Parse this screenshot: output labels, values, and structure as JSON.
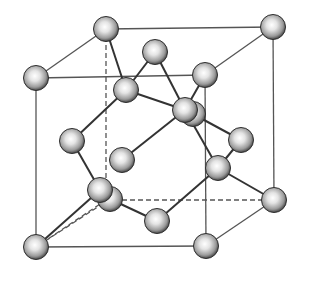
{
  "diagram": {
    "title": "Diamond cubic crystal structure (unit cell)",
    "colors": {
      "background": "#ffffff",
      "cell_edge": "#555555",
      "bond": "#333333",
      "atom_light": "#ffffff",
      "atom_mid": "#b5b5b5",
      "atom_dark": "#3a3a3a"
    },
    "atom_radius": 12.5,
    "cell": {
      "corners": {
        "back_top_left": [
          106,
          29
        ],
        "back_top_right": [
          273,
          27
        ],
        "back_bottom_left": [
          106,
          200
        ],
        "back_bottom_right": [
          274,
          200
        ],
        "front_top_left": [
          36,
          78
        ],
        "front_top_right": [
          205,
          75
        ],
        "front_bottom_left": [
          36,
          247
        ],
        "front_bottom_right": [
          206,
          246
        ]
      },
      "solid_edges": [
        [
          "front_top_left",
          "front_top_right"
        ],
        [
          "front_top_right",
          "front_bottom_right"
        ],
        [
          "front_bottom_right",
          "front_bottom_left"
        ],
        [
          "front_bottom_left",
          "front_top_left"
        ],
        [
          "back_top_left",
          "back_top_right"
        ],
        [
          "back_top_right",
          "back_bottom_right"
        ],
        [
          "front_top_left",
          "back_top_left"
        ],
        [
          "front_top_right",
          "back_top_right"
        ],
        [
          "front_bottom_right",
          "back_bottom_right"
        ]
      ],
      "dashed_edges": [
        [
          "back_top_left",
          "back_bottom_left"
        ],
        [
          "back_bottom_left",
          "back_bottom_right"
        ],
        [
          "back_bottom_left",
          "front_bottom_left"
        ]
      ]
    },
    "atoms": [
      {
        "id": "a-back-top-left",
        "x": 106,
        "y": 29
      },
      {
        "id": "a-back-top-right",
        "x": 273,
        "y": 27
      },
      {
        "id": "a-back-bottom-right",
        "x": 274,
        "y": 200
      },
      {
        "id": "a-top-face-center",
        "x": 155,
        "y": 52
      },
      {
        "id": "a-front-top-left",
        "x": 36,
        "y": 78
      },
      {
        "id": "a-front-top-right",
        "x": 205,
        "y": 75
      },
      {
        "id": "a-interior-1",
        "x": 126,
        "y": 90
      },
      {
        "id": "a-back-face-center",
        "x": 193,
        "y": 114
      },
      {
        "id": "a-interior-2",
        "x": 185,
        "y": 110
      },
      {
        "id": "a-left-face-center",
        "x": 72,
        "y": 141
      },
      {
        "id": "a-right-face-center",
        "x": 241,
        "y": 140
      },
      {
        "id": "a-interior-3",
        "x": 122,
        "y": 160
      },
      {
        "id": "a-interior-4",
        "x": 218,
        "y": 168
      },
      {
        "id": "a-bottom-face-center",
        "x": 110,
        "y": 199
      },
      {
        "id": "a-front-face-center",
        "x": 100,
        "y": 190
      },
      {
        "id": "a-interior-5",
        "x": 157,
        "y": 221
      },
      {
        "id": "a-front-bottom-left",
        "x": 36,
        "y": 247
      },
      {
        "id": "a-front-bottom-right",
        "x": 206,
        "y": 246
      }
    ],
    "bonds": [
      [
        [
          106,
          29
        ],
        [
          126,
          90
        ]
      ],
      [
        [
          155,
          52
        ],
        [
          126,
          90
        ]
      ],
      [
        [
          126,
          90
        ],
        [
          185,
          110
        ]
      ],
      [
        [
          126,
          90
        ],
        [
          72,
          141
        ]
      ],
      [
        [
          155,
          52
        ],
        [
          185,
          110
        ]
      ],
      [
        [
          205,
          75
        ],
        [
          185,
          110
        ]
      ],
      [
        [
          185,
          110
        ],
        [
          122,
          160
        ]
      ],
      [
        [
          185,
          110
        ],
        [
          218,
          168
        ]
      ],
      [
        [
          193,
          114
        ],
        [
          241,
          140
        ]
      ],
      [
        [
          241,
          140
        ],
        [
          218,
          168
        ]
      ],
      [
        [
          218,
          168
        ],
        [
          274,
          200
        ]
      ],
      [
        [
          218,
          168
        ],
        [
          157,
          221
        ]
      ],
      [
        [
          72,
          141
        ],
        [
          100,
          190
        ]
      ],
      [
        [
          100,
          190
        ],
        [
          36,
          247
        ]
      ],
      [
        [
          110,
          199
        ],
        [
          157,
          221
        ]
      ]
    ],
    "dashed_bonds": [
      [
        [
          110,
          199
        ],
        [
          36,
          247
        ]
      ]
    ]
  }
}
